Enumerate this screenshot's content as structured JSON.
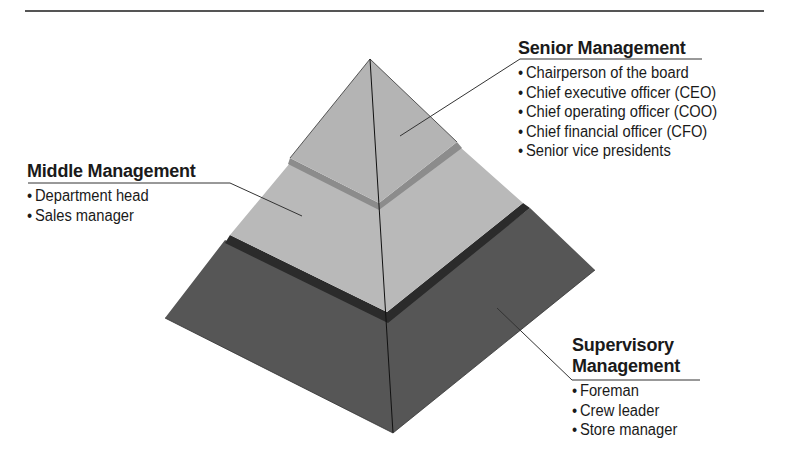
{
  "diagram": {
    "type": "pyramid",
    "colors": {
      "top_tier": "#b4b4b4",
      "senior_band": "#8c8c8c",
      "middle_tier": "#b9b9b9",
      "middle_band": "#2b2b2b",
      "base_tier": "#565656",
      "rule": "#555555"
    }
  },
  "tiers": {
    "senior": {
      "title": "Senior Management",
      "items": [
        "Chairperson of the board",
        "Chief executive officer (CEO)",
        "Chief operating officer (COO)",
        "Chief financial officer (CFO)",
        "Senior vice presidents"
      ]
    },
    "middle": {
      "title": "Middle Management",
      "items": [
        "Department head",
        "Sales manager"
      ]
    },
    "supervisory": {
      "title_line1": "Supervisory",
      "title_line2": "Management",
      "items": [
        "Foreman",
        "Crew leader",
        "Store manager"
      ]
    }
  }
}
